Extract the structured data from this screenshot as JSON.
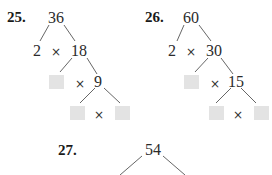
{
  "problems": [
    {
      "number": "25.",
      "root": "36",
      "level1": {
        "left": "2",
        "op": "×",
        "right": "18"
      },
      "level2": {
        "left": "",
        "op": "×",
        "right": "9"
      },
      "level3": {
        "left": "",
        "op": "×",
        "right": ""
      }
    },
    {
      "number": "26.",
      "root": "60",
      "level1": {
        "left": "2",
        "op": "×",
        "right": "30"
      },
      "level2": {
        "left": "",
        "op": "×",
        "right": "15"
      },
      "level3": {
        "left": "",
        "op": "×",
        "right": ""
      }
    },
    {
      "number": "27.",
      "root": "54"
    }
  ],
  "colors": {
    "blank_box": "#e3e3e3",
    "text": "#2b2b2b"
  }
}
